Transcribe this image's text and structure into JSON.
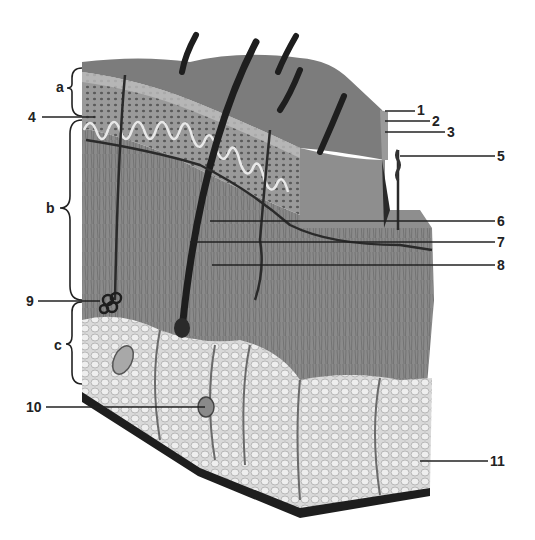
{
  "figure": {
    "type": "anatomical cross-section illustration of skin (grayscale)",
    "colors": {
      "background": "#ffffff",
      "surface": "#7a7a7a",
      "epidermis": "#8c8c8c",
      "dermis": "#8a8a8a",
      "hypodermis": "#d8d8d8",
      "dark": "#1e1e1e",
      "line": "#222222"
    }
  },
  "labels": {
    "layers": [
      {
        "id": "a",
        "text": "a"
      },
      {
        "id": "b",
        "text": "b"
      },
      {
        "id": "c",
        "text": "c"
      }
    ],
    "numbered": [
      {
        "id": "1",
        "text": "1"
      },
      {
        "id": "2",
        "text": "2"
      },
      {
        "id": "3",
        "text": "3"
      },
      {
        "id": "4",
        "text": "4"
      },
      {
        "id": "5",
        "text": "5"
      },
      {
        "id": "6",
        "text": "6"
      },
      {
        "id": "7",
        "text": "7"
      },
      {
        "id": "8",
        "text": "8"
      },
      {
        "id": "9",
        "text": "9"
      },
      {
        "id": "10",
        "text": "10"
      },
      {
        "id": "11",
        "text": "11"
      }
    ]
  }
}
